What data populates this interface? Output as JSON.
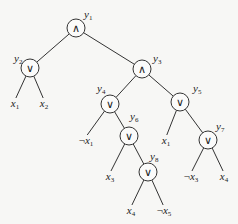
{
  "diagram": {
    "type": "boolean-formula-tree",
    "nodes": [
      {
        "id": "y1",
        "name": "y",
        "sub": "1",
        "op": "∧",
        "x": 76,
        "y": 28,
        "lx": 84,
        "ly": 18
      },
      {
        "id": "y2",
        "name": "y",
        "sub": "2",
        "op": "∨",
        "x": 30,
        "y": 68,
        "lx": 14,
        "ly": 62
      },
      {
        "id": "y3",
        "name": "y",
        "sub": "3",
        "op": "∧",
        "x": 142,
        "y": 69,
        "lx": 153,
        "ly": 62
      },
      {
        "id": "y4",
        "name": "y",
        "sub": "4",
        "op": "∨",
        "x": 110,
        "y": 104,
        "lx": 97,
        "ly": 92
      },
      {
        "id": "y5",
        "name": "y",
        "sub": "5",
        "op": "∨",
        "x": 180,
        "y": 102,
        "lx": 193,
        "ly": 92
      },
      {
        "id": "y6",
        "name": "y",
        "sub": "6",
        "op": "∨",
        "x": 129,
        "y": 136,
        "lx": 130,
        "ly": 120
      },
      {
        "id": "y7",
        "name": "y",
        "sub": "7",
        "op": "∨",
        "x": 208,
        "y": 140,
        "lx": 216,
        "ly": 130
      },
      {
        "id": "y8",
        "name": "y",
        "sub": "8",
        "op": "∨",
        "x": 148,
        "y": 172,
        "lx": 150,
        "ly": 160
      }
    ],
    "leaves": [
      {
        "id": "l1",
        "neg": "",
        "name": "x",
        "sub": "1",
        "x": 15,
        "y": 107
      },
      {
        "id": "l2",
        "neg": "",
        "name": "x",
        "sub": "2",
        "x": 44,
        "y": 107
      },
      {
        "id": "l3",
        "neg": "¬",
        "name": "x",
        "sub": "1",
        "x": 86,
        "y": 144
      },
      {
        "id": "l4",
        "neg": "",
        "name": "x",
        "sub": "3",
        "x": 110,
        "y": 180
      },
      {
        "id": "l5",
        "neg": "",
        "name": "x",
        "sub": "1",
        "x": 166,
        "y": 144
      },
      {
        "id": "l6",
        "neg": "¬",
        "name": "x",
        "sub": "3",
        "x": 191,
        "y": 180
      },
      {
        "id": "l7",
        "neg": "",
        "name": "x",
        "sub": "4",
        "x": 224,
        "y": 180
      },
      {
        "id": "l8",
        "neg": "",
        "name": "x",
        "sub": "4",
        "x": 131,
        "y": 214
      },
      {
        "id": "l9",
        "neg": "¬",
        "name": "x",
        "sub": "5",
        "x": 164,
        "y": 214
      }
    ],
    "edges": [
      {
        "from": "y1",
        "to": "y2"
      },
      {
        "from": "y1",
        "to": "y3"
      },
      {
        "from": "y2",
        "to": "l1"
      },
      {
        "from": "y2",
        "to": "l2"
      },
      {
        "from": "y3",
        "to": "y4"
      },
      {
        "from": "y3",
        "to": "y5"
      },
      {
        "from": "y4",
        "to": "l3"
      },
      {
        "from": "y4",
        "to": "y6"
      },
      {
        "from": "y5",
        "to": "l5"
      },
      {
        "from": "y5",
        "to": "y7"
      },
      {
        "from": "y6",
        "to": "l4"
      },
      {
        "from": "y6",
        "to": "y8"
      },
      {
        "from": "y7",
        "to": "l6"
      },
      {
        "from": "y7",
        "to": "l7"
      },
      {
        "from": "y8",
        "to": "l8"
      },
      {
        "from": "y8",
        "to": "l9"
      }
    ]
  }
}
